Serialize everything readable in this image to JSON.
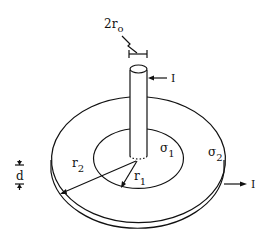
{
  "diagram": {
    "labels": {
      "rod_diameter": "2r",
      "rod_diameter_sub": "o",
      "current_in": "I",
      "current_out": "I",
      "inner_conductivity": "σ",
      "inner_conductivity_sub": "1",
      "outer_conductivity": "σ",
      "outer_conductivity_sub": "2",
      "inner_radius": "r",
      "inner_radius_sub": "1",
      "outer_radius": "r",
      "outer_radius_sub": "2",
      "thickness": "d"
    },
    "colors": {
      "line": "#111111",
      "background": "#ffffff"
    }
  }
}
